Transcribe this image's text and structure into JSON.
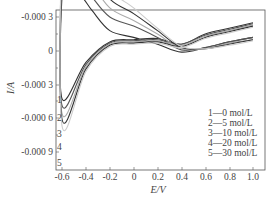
{
  "chart_data": {
    "type": "line",
    "title": "",
    "xlabel": "E/V",
    "ylabel": "I/A",
    "xlim": [
      -0.65,
      1.05
    ],
    "ylim": [
      0.0011,
      -0.0004
    ],
    "y_inverted": true,
    "grid": false,
    "x_ticks": [
      "-0.6",
      "-0.4",
      "-0.2",
      "0",
      "0.2",
      "0.4",
      "0.6",
      "0.8",
      "1.0"
    ],
    "y_ticks": [
      "-0.000 3",
      "0",
      "-0.000 3",
      "-0.000 6",
      "-0.000 9"
    ],
    "legend_position": "lower right",
    "legend": [
      {
        "id": "1",
        "label": "1—0 mol/L"
      },
      {
        "id": "2",
        "label": "2—5 mol/L"
      },
      {
        "id": "3",
        "label": "3—10 mol/L"
      },
      {
        "id": "4",
        "label": "4—20 mol/L"
      },
      {
        "id": "5",
        "label": "5—30 mol/L"
      }
    ],
    "series": [
      {
        "name": "1—0 mol/L",
        "color": "#333333",
        "forward": {
          "x": [
            -0.6,
            -0.55,
            -0.45,
            -0.35,
            -0.2,
            0,
            0.2,
            0.4,
            0.6,
            0.8,
            1.0
          ],
          "y": [
            -0.00048,
            -0.00046,
            -0.00049,
            -0.00036,
            -0.00018,
            -0.00012,
            -6e-05,
            1e-05,
            -3e-05,
            -8e-05,
            -0.00012
          ]
        },
        "reverse": {
          "x": [
            1.0,
            0.8,
            0.6,
            0.4,
            0.2,
            0,
            -0.2,
            -0.4,
            -0.6
          ],
          "y": [
            -0.00025,
            -0.0002,
            -0.00015,
            -6e-05,
            -0.00011,
            -0.0001,
            -8e-05,
            0.0001,
            0.00042
          ]
        }
      },
      {
        "name": "2—5 mol/L",
        "color": "#555555",
        "forward": {
          "x": [
            -0.6,
            -0.55,
            -0.45,
            -0.35,
            -0.2,
            0,
            0.2,
            0.4,
            0.6,
            0.8,
            1.0
          ],
          "y": [
            -0.00064,
            -0.0006,
            -0.00064,
            -0.00048,
            -0.0003,
            -0.00022,
            -0.00012,
            -1e-05,
            -3e-05,
            -8e-05,
            -0.00012
          ]
        },
        "reverse": {
          "x": [
            1.0,
            0.8,
            0.6,
            0.4,
            0.2,
            0,
            -0.2,
            -0.4,
            -0.6
          ],
          "y": [
            -0.00024,
            -0.00019,
            -0.00014,
            -6e-05,
            -0.0001,
            -9e-05,
            -7e-05,
            0.00012,
            0.00048
          ]
        }
      },
      {
        "name": "3—10 mol/L",
        "color": "#aaaaaa",
        "forward": {
          "x": [
            -0.6,
            -0.55,
            -0.45,
            -0.35,
            -0.2,
            0,
            0.2,
            0.4,
            0.6,
            0.8,
            1.0
          ],
          "y": [
            -0.00078,
            -0.00075,
            -0.00078,
            -0.0006,
            -0.00038,
            -0.00027,
            -0.00015,
            -2e-05,
            -2e-05,
            -7e-05,
            -0.0001
          ]
        },
        "reverse": {
          "x": [
            1.0,
            0.8,
            0.6,
            0.4,
            0.2,
            0,
            -0.2,
            -0.4,
            -0.6
          ],
          "y": [
            -0.00023,
            -0.00018,
            -0.00013,
            -5e-05,
            -9e-05,
            -8e-05,
            -6e-05,
            0.00014,
            0.00055
          ]
        }
      },
      {
        "name": "4—20 mol/L",
        "color": "#333333",
        "forward": {
          "x": [
            -0.6,
            -0.55,
            -0.45,
            -0.35,
            -0.2,
            0,
            0.2,
            0.4,
            0.6,
            0.8,
            1.0
          ],
          "y": [
            -0.00092,
            -0.00088,
            -0.00092,
            -0.00072,
            -0.00046,
            -0.00033,
            -0.00018,
            -3e-05,
            -2e-05,
            -6e-05,
            -0.0001
          ]
        },
        "reverse": {
          "x": [
            1.0,
            0.8,
            0.6,
            0.4,
            0.2,
            0,
            -0.2,
            -0.4,
            -0.6
          ],
          "y": [
            -0.00022,
            -0.00017,
            -0.00012,
            -4e-05,
            -8e-05,
            -7e-05,
            -5e-05,
            0.00016,
            0.0006
          ]
        }
      },
      {
        "name": "5—30 mol/L",
        "color": "#cccccc",
        "forward": {
          "x": [
            -0.6,
            -0.55,
            -0.45,
            -0.35,
            -0.2,
            0,
            0.2,
            0.4,
            0.6,
            0.8,
            1.0
          ],
          "y": [
            -0.00104,
            -0.001,
            -0.00103,
            -0.00082,
            -0.00054,
            -0.00038,
            -0.0002,
            -4e-05,
            -2e-05,
            -5e-05,
            -9e-05
          ]
        },
        "reverse": {
          "x": [
            1.0,
            0.8,
            0.6,
            0.4,
            0.2,
            0,
            -0.2,
            -0.4,
            -0.6
          ],
          "y": [
            -0.00021,
            -0.00016,
            -0.00011,
            -3e-05,
            -7e-05,
            -6e-05,
            -4e-05,
            0.00018,
            0.00066
          ]
        }
      }
    ]
  },
  "axes": {
    "xlabel": "E/V",
    "ylabel": "I/A",
    "x_ticks": [
      "-0.6",
      "-0.4",
      "-0.2",
      "0",
      "0.2",
      "0.4",
      "0.6",
      "0.8",
      "1.0"
    ],
    "y_ticks": [
      "-0.000 3",
      "0",
      "-0.000 3",
      "-0.000 6",
      "-0.000 9"
    ]
  },
  "legend": [
    "1—0 mol/L",
    "2—5 mol/L",
    "3—10 mol/L",
    "4—20 mol/L",
    "5—30 mol/L"
  ],
  "curve_labels": [
    "1",
    "2",
    "3",
    "4",
    "5"
  ]
}
